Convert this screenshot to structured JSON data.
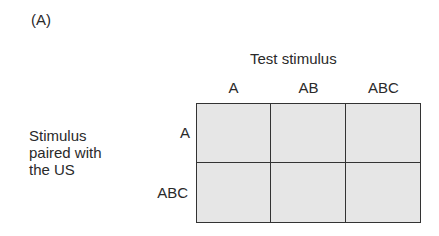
{
  "panel_label": "(A)",
  "column_axis_title": "Test stimulus",
  "columns": [
    "A",
    "AB",
    "ABC"
  ],
  "row_axis_title_lines": [
    "Stimulus",
    "paired with",
    "the US"
  ],
  "rows": [
    "A",
    "ABC"
  ],
  "cell_fill_color": "#e6e6e6",
  "line_color": "#333333"
}
